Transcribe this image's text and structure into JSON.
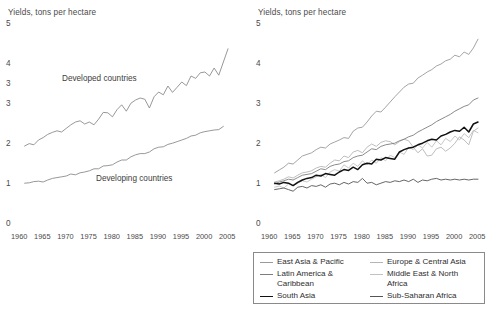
{
  "figure": {
    "background": "#ffffff",
    "text_color": "#3d3d3d"
  },
  "left_chart": {
    "title": "Yields, tons per hectare",
    "yticks": [
      "5",
      "4",
      "3",
      "3",
      "2",
      "1",
      "0"
    ],
    "xticks": [
      "1960",
      "1965",
      "1970",
      "1975",
      "1980",
      "1985",
      "1990",
      "1995",
      "2000",
      "2005"
    ],
    "labels": {
      "developed": "Developed countries",
      "developing": "Developing countries"
    }
  },
  "right_chart": {
    "title": "Yields, tons per hectare",
    "yticks": [
      "5",
      "4",
      "3",
      "2",
      "1",
      "0"
    ],
    "xticks": [
      "1960",
      "1965",
      "1970",
      "1975",
      "1980",
      "1985",
      "1990",
      "1995",
      "2000",
      "2005"
    ]
  },
  "legend": {
    "items": [
      {
        "label": "East Asia & Pacific",
        "color": "#9a9a9a",
        "width": 1.2,
        "column": 0
      },
      {
        "label": "Latin America &\nCaribbean",
        "color": "#7d7d7d",
        "width": 1.2,
        "column": 0
      },
      {
        "label": "South Asia",
        "color": "#111111",
        "width": 1.9,
        "column": 0
      },
      {
        "label": "Europe & Central Asia",
        "color": "#b5b5b5",
        "width": 1.2,
        "column": 1
      },
      {
        "label": "Middle East & North\nAfrica",
        "color": "#c2c2c2",
        "width": 1.2,
        "column": 1
      },
      {
        "label": "Sub-Saharan Africa",
        "color": "#555555",
        "width": 1.4,
        "column": 1
      }
    ]
  },
  "chart_data": [
    {
      "type": "line",
      "id": "left",
      "title": "Yields, tons per hectare",
      "xlabel": "",
      "ylabel": "Yields, tons per hectare",
      "xlim": [
        1960,
        2005
      ],
      "ylim": [
        0,
        5
      ],
      "grid": false,
      "legend_position": "inline-annotations",
      "xticks": [
        1960,
        1965,
        1970,
        1975,
        1980,
        1985,
        1990,
        1995,
        2000,
        2005
      ],
      "ytick_labels": [
        "5",
        "4",
        "3",
        "3",
        "2",
        "1",
        "0"
      ],
      "ytick_values": [
        5,
        4,
        3.5,
        3,
        2,
        1,
        0
      ],
      "x": [
        1961,
        1962,
        1963,
        1964,
        1965,
        1966,
        1967,
        1968,
        1969,
        1970,
        1971,
        1972,
        1973,
        1974,
        1975,
        1976,
        1977,
        1978,
        1979,
        1980,
        1981,
        1982,
        1983,
        1984,
        1985,
        1986,
        1987,
        1988,
        1989,
        1990,
        1991,
        1992,
        1993,
        1994,
        1995,
        1996,
        1997,
        1998,
        1999,
        2000,
        2001,
        2002,
        2003,
        2004
      ],
      "series": [
        {
          "name": "Developed countries",
          "color": "#8c8c8c",
          "values": [
            1.95,
            2.01,
            1.98,
            2.1,
            2.16,
            2.24,
            2.29,
            2.33,
            2.3,
            2.39,
            2.48,
            2.55,
            2.58,
            2.5,
            2.55,
            2.48,
            2.62,
            2.79,
            2.78,
            2.68,
            2.86,
            2.98,
            2.82,
            3.02,
            3.1,
            3.15,
            3.12,
            2.9,
            3.18,
            3.3,
            3.23,
            3.45,
            3.29,
            3.42,
            3.55,
            3.46,
            3.7,
            3.64,
            3.78,
            3.8,
            3.7,
            3.9,
            3.72,
            4.05,
            4.38
          ]
        },
        {
          "name": "Developing countries",
          "color": "#8c8c8c",
          "values": [
            1.02,
            1.03,
            1.06,
            1.07,
            1.05,
            1.1,
            1.14,
            1.16,
            1.18,
            1.2,
            1.25,
            1.23,
            1.28,
            1.3,
            1.33,
            1.38,
            1.38,
            1.45,
            1.46,
            1.48,
            1.55,
            1.6,
            1.6,
            1.68,
            1.73,
            1.76,
            1.76,
            1.8,
            1.88,
            1.92,
            1.93,
            1.99,
            2.02,
            2.06,
            2.1,
            2.14,
            2.2,
            2.22,
            2.28,
            2.31,
            2.33,
            2.35,
            2.36,
            2.44
          ]
        }
      ]
    },
    {
      "type": "line",
      "id": "right",
      "title": "Yields, tons per hectare",
      "xlabel": "",
      "ylabel": "Yields, tons per hectare",
      "xlim": [
        1960,
        2005
      ],
      "ylim": [
        0,
        5
      ],
      "grid": false,
      "legend_position": "bottom",
      "xticks": [
        1960,
        1965,
        1970,
        1975,
        1980,
        1985,
        1990,
        1995,
        2000,
        2005
      ],
      "ytick_labels": [
        "5",
        "4",
        "3",
        "2",
        "1",
        "0"
      ],
      "ytick_values": [
        5,
        4,
        3,
        2,
        1,
        0
      ],
      "x": [
        1961,
        1962,
        1963,
        1964,
        1965,
        1966,
        1967,
        1968,
        1969,
        1970,
        1971,
        1972,
        1973,
        1974,
        1975,
        1976,
        1977,
        1978,
        1979,
        1980,
        1981,
        1982,
        1983,
        1984,
        1985,
        1986,
        1987,
        1988,
        1989,
        1990,
        1991,
        1992,
        1993,
        1994,
        1995,
        1996,
        1997,
        1998,
        1999,
        2000,
        2001,
        2002,
        2003,
        2004
      ],
      "series": [
        {
          "name": "East Asia & Pacific",
          "color": "#9a9a9a",
          "values": [
            1.28,
            1.35,
            1.42,
            1.52,
            1.5,
            1.6,
            1.7,
            1.74,
            1.78,
            1.86,
            1.92,
            1.9,
            2.0,
            2.05,
            2.1,
            2.16,
            2.14,
            2.32,
            2.4,
            2.42,
            2.55,
            2.7,
            2.82,
            2.8,
            2.92,
            3.05,
            3.18,
            3.3,
            3.42,
            3.5,
            3.52,
            3.65,
            3.72,
            3.8,
            3.86,
            3.95,
            4.0,
            4.08,
            4.12,
            4.22,
            4.18,
            4.3,
            4.24,
            4.4,
            4.62
          ]
        },
        {
          "name": "Europe & Central Asia",
          "color": "#b5b5b5",
          "values": [
            1.05,
            1.08,
            1.12,
            1.18,
            1.15,
            1.22,
            1.28,
            1.3,
            1.33,
            1.4,
            1.44,
            1.42,
            1.52,
            1.6,
            1.58,
            1.7,
            1.66,
            1.8,
            1.84,
            1.78,
            1.92,
            2.0,
            1.94,
            2.04,
            2.08,
            2.06,
            1.98,
            2.06,
            2.12,
            2.08,
            1.92,
            1.78,
            1.88,
            1.7,
            1.72,
            1.88,
            1.92,
            1.82,
            1.9,
            2.02,
            2.18,
            2.1,
            1.98,
            2.32,
            2.4
          ]
        },
        {
          "name": "Latin America & Caribbean",
          "color": "#7d7d7d",
          "values": [
            1.0,
            1.05,
            1.08,
            1.12,
            1.1,
            1.16,
            1.22,
            1.24,
            1.26,
            1.32,
            1.38,
            1.36,
            1.44,
            1.48,
            1.5,
            1.56,
            1.58,
            1.66,
            1.7,
            1.72,
            1.8,
            1.88,
            1.86,
            1.94,
            1.98,
            2.0,
            2.02,
            2.08,
            2.12,
            2.18,
            2.22,
            2.3,
            2.36,
            2.42,
            2.48,
            2.56,
            2.62,
            2.68,
            2.74,
            2.82,
            2.88,
            2.94,
            2.98,
            3.1,
            3.15
          ]
        },
        {
          "name": "Middle East & North Africa",
          "color": "#c2c2c2",
          "values": [
            0.92,
            0.95,
            0.9,
            1.0,
            0.96,
            1.02,
            1.08,
            1.05,
            1.12,
            1.18,
            1.24,
            1.16,
            1.3,
            1.36,
            1.32,
            1.48,
            1.4,
            1.52,
            1.44,
            1.58,
            1.48,
            1.6,
            1.52,
            1.66,
            1.58,
            1.72,
            1.66,
            1.8,
            1.74,
            1.92,
            1.86,
            1.98,
            1.9,
            2.04,
            1.92,
            2.08,
            1.98,
            2.14,
            2.06,
            2.2,
            2.1,
            2.26,
            2.16,
            2.34,
            2.28
          ]
        },
        {
          "name": "South Asia",
          "color": "#111111",
          "values": [
            1.02,
            1.0,
            1.04,
            1.02,
            0.96,
            1.04,
            1.1,
            1.14,
            1.16,
            1.22,
            1.2,
            1.26,
            1.24,
            1.22,
            1.3,
            1.36,
            1.34,
            1.42,
            1.36,
            1.48,
            1.52,
            1.5,
            1.62,
            1.6,
            1.66,
            1.64,
            1.62,
            1.8,
            1.86,
            1.9,
            1.92,
            1.98,
            2.02,
            2.08,
            2.12,
            2.1,
            2.2,
            2.24,
            2.3,
            2.34,
            2.32,
            2.42,
            2.3,
            2.5,
            2.55
          ]
        },
        {
          "name": "Sub-Saharan Africa",
          "color": "#555555",
          "values": [
            0.86,
            0.88,
            0.9,
            0.86,
            0.82,
            0.92,
            0.94,
            0.9,
            0.96,
            0.94,
            0.98,
            0.92,
            1.0,
            1.02,
            0.98,
            1.04,
            1.0,
            1.06,
            1.04,
            1.14,
            1.02,
            1.04,
            0.98,
            1.02,
            1.06,
            1.04,
            1.08,
            1.06,
            1.1,
            1.06,
            1.12,
            1.04,
            1.1,
            1.08,
            1.12,
            1.14,
            1.1,
            1.12,
            1.1,
            1.12,
            1.1,
            1.12,
            1.1,
            1.12,
            1.12
          ]
        }
      ]
    }
  ]
}
